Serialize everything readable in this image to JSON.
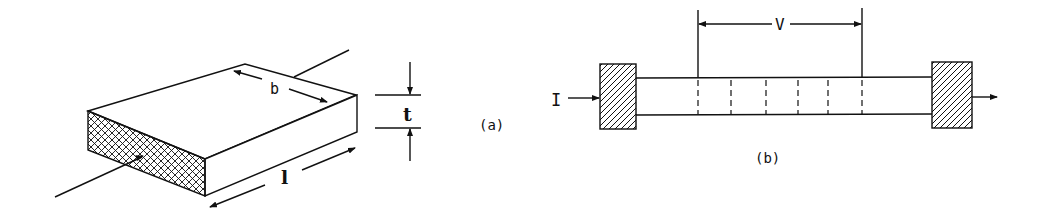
{
  "figure": {
    "panel_a": {
      "caption": "(a)",
      "labels": {
        "width": "b",
        "thickness": "t",
        "length": "l"
      },
      "description": "Rectangular slab sample with cross-hatched end face and leads"
    },
    "panel_b": {
      "caption": "(b)",
      "labels": {
        "current": "I",
        "voltage": "V"
      },
      "description": "Bar sample between hatched contact blocks with voltage probes"
    }
  },
  "colors": {
    "ink": "#111111",
    "background": "#ffffff"
  }
}
